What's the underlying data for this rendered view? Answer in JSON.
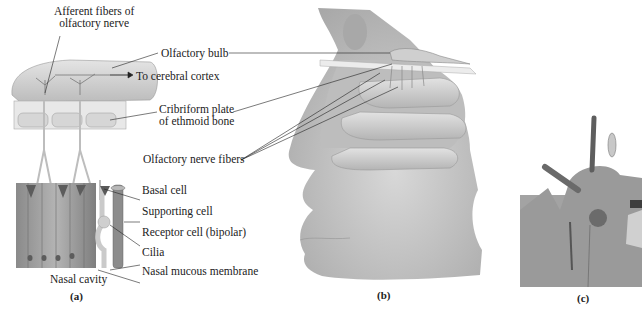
{
  "figure": {
    "panel_a": {
      "id": "(a)",
      "labels": {
        "afferent_line1": "Afferent fibers of",
        "afferent_line2": "olfactory nerve",
        "olfactory_bulb": "Olfactory bulb",
        "to_cortex": "To cerebral cortex",
        "cribriform_line1": "Cribriform plate",
        "cribriform_line2": "of ethmoid bone",
        "olfactory_nerve_fibers": "Olfactory nerve fibers",
        "basal_cell": "Basal cell",
        "supporting_cell": "Supporting cell",
        "receptor_cell": "Receptor cell (bipolar)",
        "cilia": "Cilia",
        "nasal_cavity": "Nasal cavity",
        "nasal_mucous_membrane": "Nasal mucous membrane"
      }
    },
    "panel_b": {
      "id": "(b)"
    },
    "panel_c": {
      "id": "(c)"
    },
    "colors": {
      "bulb": "#d2d2d2",
      "bone": "#e6e6e6",
      "cell_dark": "#7a7a7a",
      "cell_mid": "#a8a8a8",
      "head_shade": "#c8c8c8",
      "micrograph": "#9a9a9a"
    }
  }
}
